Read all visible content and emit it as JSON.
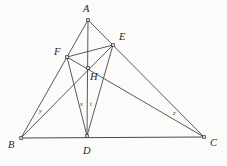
{
  "figure": {
    "kind": "geometry-diagram",
    "width": 227,
    "height": 166,
    "background_color": "#fbfbfa",
    "stroke_color": "#3c3c3c",
    "label_color": "#262626"
  },
  "points": [
    {
      "id": "A",
      "label": "A",
      "x": 88,
      "y": 20,
      "label_x": 83,
      "label_y": 4
    },
    {
      "id": "B",
      "label": "B",
      "x": 21,
      "y": 138,
      "label_x": 8,
      "label_y": 140
    },
    {
      "id": "C",
      "label": "C",
      "x": 204,
      "y": 137,
      "label_x": 210,
      "label_y": 138
    },
    {
      "id": "D",
      "label": "D",
      "x": 87,
      "y": 136,
      "label_x": 83,
      "label_y": 146
    },
    {
      "id": "E",
      "label": "E",
      "x": 113,
      "y": 45,
      "label_x": 119,
      "label_y": 32
    },
    {
      "id": "F",
      "label": "F",
      "x": 67,
      "y": 57,
      "label_x": 54,
      "label_y": 47
    },
    {
      "id": "H",
      "label": "H",
      "x": 88,
      "y": 68,
      "label_x": 90,
      "label_y": 72
    }
  ],
  "segments": [
    {
      "id": "AB",
      "from": "A",
      "to": "B",
      "style": "thin"
    },
    {
      "id": "AC",
      "from": "A",
      "to": "C",
      "style": "thin"
    },
    {
      "id": "BC",
      "from": "B",
      "to": "C",
      "style": "base"
    },
    {
      "id": "AD",
      "from": "A",
      "to": "D",
      "style": "thin"
    },
    {
      "id": "BE",
      "from": "B",
      "to": "E",
      "style": "thin"
    },
    {
      "id": "CF",
      "from": "C",
      "to": "F",
      "style": "thin"
    },
    {
      "id": "FE",
      "from": "F",
      "to": "E",
      "style": "thin"
    },
    {
      "id": "FD",
      "from": "F",
      "to": "D",
      "style": "thin"
    },
    {
      "id": "ED",
      "from": "E",
      "to": "D",
      "style": "thin"
    }
  ],
  "segment_labels": [
    {
      "id": "y",
      "label": "y",
      "x": 39,
      "y": 108,
      "on": "BE"
    },
    {
      "id": "x",
      "label": "x",
      "x": 80,
      "y": 101,
      "on": "AD"
    },
    {
      "id": "t",
      "label": "t",
      "x": 90,
      "y": 101,
      "on": "ED"
    },
    {
      "id": "z",
      "label": "z",
      "x": 173,
      "y": 110,
      "on": "CF"
    }
  ]
}
